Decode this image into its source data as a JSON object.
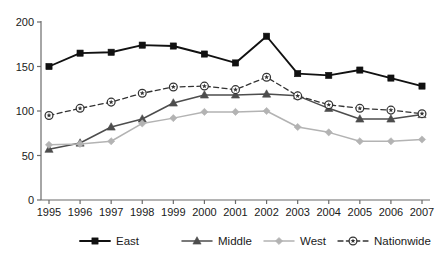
{
  "chart_data": {
    "type": "line",
    "title": "",
    "xlabel": "",
    "ylabel": "",
    "ylim": [
      0,
      200
    ],
    "yticks": [
      0,
      50,
      100,
      150,
      200
    ],
    "grid": false,
    "legend_position": "bottom",
    "categories": [
      "1995",
      "1996",
      "1997",
      "1998",
      "1999",
      "2000",
      "2001",
      "2002",
      "2003",
      "2004",
      "2005",
      "2006",
      "2007"
    ],
    "series": [
      {
        "name": "East",
        "color": "#111111",
        "marker": "square",
        "dash": "solid",
        "values": [
          150,
          165,
          166,
          174,
          173,
          164,
          154,
          184,
          142,
          140,
          146,
          137,
          128
        ]
      },
      {
        "name": "Middle",
        "color": "#4d4d4d",
        "marker": "triangle",
        "dash": "solid",
        "values": [
          57,
          64,
          82,
          91,
          109,
          118,
          118,
          119,
          117,
          103,
          91,
          91,
          96
        ]
      },
      {
        "name": "West",
        "color": "#b3b3b3",
        "marker": "diamond",
        "dash": "solid",
        "values": [
          62,
          63,
          66,
          86,
          92,
          99,
          99,
          100,
          82,
          76,
          66,
          66,
          68
        ]
      },
      {
        "name": "Nationwide",
        "color": "#333333",
        "marker": "circle-star",
        "dash": "dashed",
        "values": [
          95,
          103,
          110,
          120,
          127,
          128,
          124,
          138,
          117,
          107,
          103,
          101,
          97
        ]
      }
    ]
  },
  "legend": {
    "items": [
      {
        "label": "East"
      },
      {
        "label": "Middle"
      },
      {
        "label": "West"
      },
      {
        "label": "Nationwide"
      }
    ]
  }
}
